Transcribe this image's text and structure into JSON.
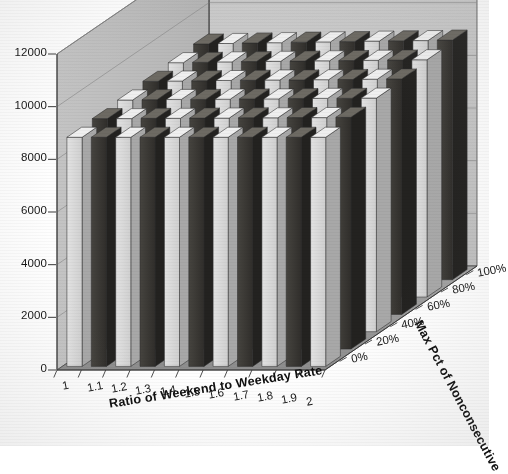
{
  "chart_data": {
    "type": "bar",
    "subtype": "3d-column",
    "title": "",
    "xlabel": "Ratio of Weekend to Weekday Rate",
    "ylabel": "",
    "zlabel": "Max Pct of Nonconsecutive",
    "ylim": [
      0,
      12000
    ],
    "ytick_step": 2000,
    "grid": true,
    "legend": "none",
    "categories": [
      "1",
      "1.1",
      "1.2",
      "1.3",
      "1.4",
      "1.5",
      "1.6",
      "1.7",
      "1.8",
      "1.9",
      "2"
    ],
    "depth_categories": [
      "0%",
      "20%",
      "40%",
      "60%",
      "80%",
      "100%"
    ],
    "yticks": [
      "0",
      "2000",
      "4000",
      "6000",
      "8000",
      "10000",
      "12000"
    ],
    "ytick_values": [
      0,
      2000,
      4000,
      6000,
      8000,
      10000,
      12000
    ],
    "series": [
      {
        "name": "0%",
        "values": [
          8700,
          8700,
          8700,
          8700,
          8700,
          8700,
          8700,
          8700,
          8700,
          8700,
          8700
        ]
      },
      {
        "name": "20%",
        "values": [
          8750,
          8750,
          8760,
          8760,
          8770,
          8770,
          8780,
          8780,
          8790,
          8790,
          8800
        ]
      },
      {
        "name": "40%",
        "values": [
          8800,
          8810,
          8820,
          8820,
          8830,
          8840,
          8840,
          8850,
          8860,
          8860,
          8870
        ]
      },
      {
        "name": "60%",
        "values": [
          8850,
          8860,
          8870,
          8880,
          8890,
          8900,
          8900,
          8910,
          8920,
          8930,
          8940
        ]
      },
      {
        "name": "80%",
        "values": [
          8900,
          8910,
          8930,
          8940,
          8950,
          8960,
          8970,
          8980,
          8990,
          9000,
          9010
        ]
      },
      {
        "name": "100%",
        "values": [
          8950,
          8970,
          8990,
          9000,
          9020,
          9030,
          9040,
          9060,
          9070,
          9080,
          9100
        ]
      }
    ]
  },
  "axes": {
    "y_ticks": [
      "12000",
      "10000",
      "8000",
      "6000",
      "4000",
      "2000",
      "0"
    ],
    "x_ticks": [
      "1",
      "1.1",
      "1.2",
      "1.3",
      "1.4",
      "1.5",
      "1.6",
      "1.7",
      "1.8",
      "1.9",
      "2"
    ],
    "z_ticks": [
      "100%",
      "80%",
      "60%",
      "40%",
      "20%",
      "0%"
    ],
    "x_title": "Ratio of Weekend to Weekday Rate",
    "z_title": "Max Pct of Nonconsecutive"
  },
  "colors": {
    "wall_back": "#c6c6c6",
    "wall_side": "#bdbdbd",
    "floor": "#9a9a9a",
    "grid": "#8e8e8e",
    "bar_light": "#d9d9d9",
    "bar_dark": "#3c3a36",
    "bar_top": "#efefef",
    "outline": "#4a4a4a",
    "text": "#141414"
  }
}
